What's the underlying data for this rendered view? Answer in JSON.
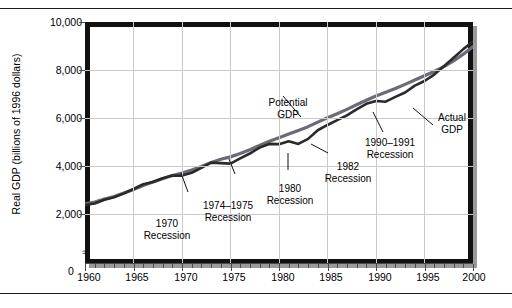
{
  "figure": {
    "rule_top": "",
    "rule_bottom": ""
  },
  "axes": {
    "y_title": "Real GDP (billions of 1996 dollars)",
    "y_ticks": [
      "10,000",
      "8,000",
      "6,000",
      "4,000",
      "2,000"
    ],
    "y_zero": "0",
    "axis_break_symbol": "≈",
    "x_ticks": [
      "1960",
      "1965",
      "1970",
      "1975",
      "1980",
      "1985",
      "1990",
      "1995",
      "2000"
    ]
  },
  "annotations": {
    "potential_gdp": "Potential\nGDP",
    "potential_gdp_l1": "Potential",
    "potential_gdp_l2": "GDP",
    "actual_gdp_l1": "Actual",
    "actual_gdp_l2": "GDP",
    "rec1970_l1": "1970",
    "rec1970_l2": "Recession",
    "rec1974_l1": "1974–1975",
    "rec1974_l2": "Recession",
    "rec1980_l1": "1980",
    "rec1980_l2": "Recession",
    "rec1982_l1": "1982",
    "rec1982_l2": "Recession",
    "rec1990_l1": "1990–1991",
    "rec1990_l2": "Recession"
  },
  "colors": {
    "potential_line": "#6b6b78",
    "actual_line": "#2a2a2a",
    "grid": "#c9c9c9",
    "frame": "#111111",
    "axis": "#4a4a4a"
  },
  "chart_data": {
    "type": "line",
    "title": "",
    "xlabel": "",
    "ylabel": "Real GDP (billions of 1996 dollars)",
    "xlim": [
      1960,
      2000
    ],
    "ylim": [
      0,
      10000
    ],
    "y_axis_broken_below": 2000,
    "grid": true,
    "legend": "inline-annotations",
    "x": [
      1960,
      1961,
      1962,
      1963,
      1964,
      1965,
      1966,
      1967,
      1968,
      1969,
      1970,
      1971,
      1972,
      1973,
      1974,
      1975,
      1976,
      1977,
      1978,
      1979,
      1980,
      1981,
      1982,
      1983,
      1984,
      1985,
      1986,
      1987,
      1988,
      1989,
      1990,
      1991,
      1992,
      1993,
      1994,
      1995,
      1996,
      1997,
      1998,
      1999,
      2000
    ],
    "series": [
      {
        "name": "Potential GDP",
        "values": [
          2420,
          2500,
          2620,
          2730,
          2870,
          3020,
          3190,
          3330,
          3470,
          3600,
          3710,
          3830,
          3980,
          4150,
          4280,
          4380,
          4520,
          4680,
          4860,
          5030,
          5180,
          5330,
          5480,
          5640,
          5830,
          6010,
          6180,
          6360,
          6550,
          6740,
          6920,
          7070,
          7230,
          7400,
          7580,
          7760,
          7940,
          8140,
          8380,
          8660,
          8980
        ]
      },
      {
        "name": "Actual GDP",
        "values": [
          2380,
          2440,
          2590,
          2700,
          2860,
          3040,
          3240,
          3330,
          3490,
          3600,
          3600,
          3720,
          3920,
          4140,
          4120,
          4100,
          4320,
          4520,
          4770,
          4920,
          4910,
          5030,
          4920,
          5130,
          5490,
          5710,
          5910,
          6110,
          6360,
          6590,
          6710,
          6680,
          6880,
          7060,
          7350,
          7540,
          7810,
          8160,
          8510,
          8870,
          9190
        ]
      }
    ],
    "annotations": [
      {
        "label": "1970 Recession",
        "year": 1970
      },
      {
        "label": "1974–1975 Recession",
        "year": 1975
      },
      {
        "label": "1980 Recession",
        "year": 1980
      },
      {
        "label": "1982 Recession",
        "year": 1982
      },
      {
        "label": "1990–1991 Recession",
        "year": 1991
      },
      {
        "label": "Potential GDP",
        "year": 1983
      },
      {
        "label": "Actual GDP",
        "year": 1994
      }
    ]
  }
}
